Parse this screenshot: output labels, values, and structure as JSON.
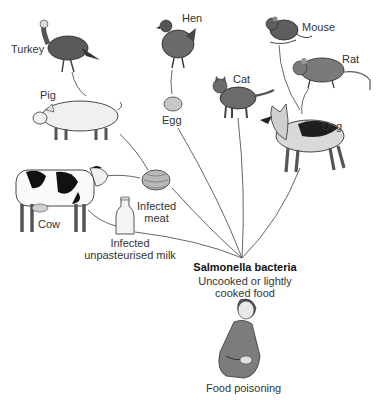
{
  "diagram": {
    "sources": {
      "turkey": "Turkey",
      "hen": "Hen",
      "mouse": "Mouse",
      "rat": "Rat",
      "pig": "Pig",
      "cat": "Cat",
      "dog": "Dog",
      "egg": "Egg",
      "cow": "Cow",
      "meat_line1": "Infected",
      "meat_line2": "meat",
      "milk_line1": "Infected",
      "milk_line2": "unpasteurised milk"
    },
    "hub": {
      "title": "Salmonella bacteria",
      "line1": "Uncooked or lightly",
      "line2": "cooked food"
    },
    "outcome": "Food poisoning",
    "colors": {
      "line": "#555555",
      "animal_dark": "#5a5a5a",
      "animal_mid": "#8c8c8c",
      "animal_light": "#e6e6e6"
    }
  }
}
